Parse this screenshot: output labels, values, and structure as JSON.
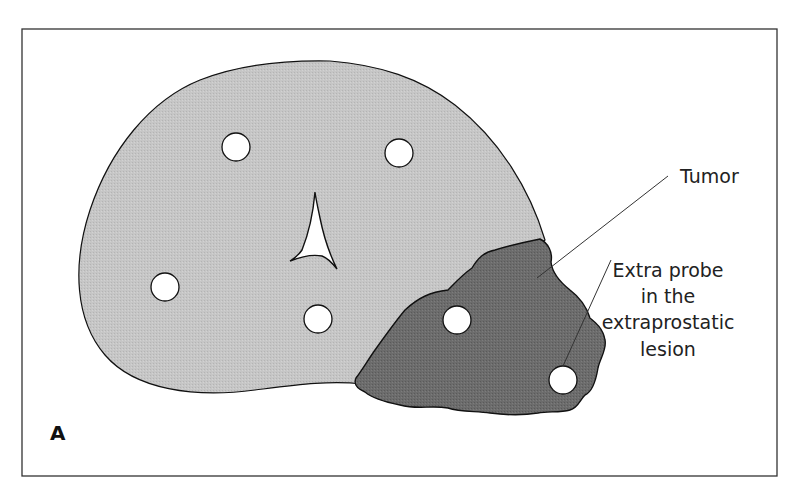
{
  "figure": {
    "panel_letter": "A",
    "colors": {
      "frame": "#333333",
      "prostate_fill": "#c4c4c4",
      "tumor_fill": "#6a6a6a",
      "outline": "#111111",
      "probe_fill": "#ffffff",
      "leader_line": "#333333",
      "text": "#222222"
    },
    "labels": {
      "tumor": "Tumor",
      "extra_probe_line1": "Extra probe",
      "extra_probe_line2": "in the",
      "extra_probe_line3": "extraprostatic",
      "extra_probe_line4": "lesion"
    },
    "probes": [
      {
        "name": "probe-upper-left",
        "cx": 236,
        "cy": 147
      },
      {
        "name": "probe-upper-right",
        "cx": 399,
        "cy": 153
      },
      {
        "name": "probe-left",
        "cx": 165,
        "cy": 287
      },
      {
        "name": "probe-center",
        "cx": 318,
        "cy": 319
      },
      {
        "name": "probe-tumor",
        "cx": 457,
        "cy": 320
      },
      {
        "name": "probe-extra",
        "cx": 563,
        "cy": 380
      }
    ],
    "probe_radius": 14
  }
}
